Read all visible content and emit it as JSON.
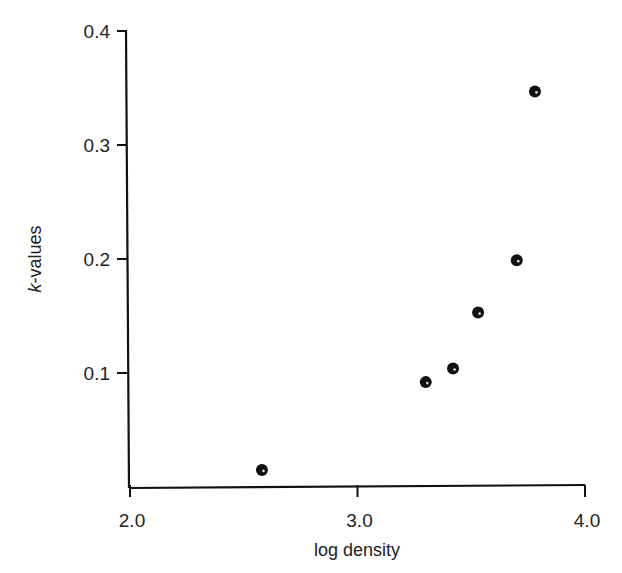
{
  "chart_data": {
    "type": "scatter",
    "title": "",
    "xlabel": "log density",
    "ylabel_italic_prefix": "k",
    "ylabel_suffix": "-values",
    "ylabel": "k-values",
    "xlim": [
      2.0,
      4.0
    ],
    "ylim": [
      0.0,
      0.4
    ],
    "x_ticks": [
      "2.0",
      "3.0",
      "4.0"
    ],
    "y_ticks": [
      "0.1",
      "0.2",
      "0.3",
      "0.4"
    ],
    "grid": false,
    "legend": null,
    "points": [
      {
        "x": 2.58,
        "y": 0.015
      },
      {
        "x": 3.3,
        "y": 0.092
      },
      {
        "x": 3.42,
        "y": 0.104
      },
      {
        "x": 3.53,
        "y": 0.153
      },
      {
        "x": 3.7,
        "y": 0.199
      },
      {
        "x": 3.78,
        "y": 0.347
      }
    ],
    "marker_color": "#111111"
  }
}
